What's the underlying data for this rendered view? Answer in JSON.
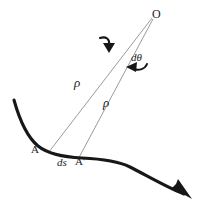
{
  "figure": {
    "background_color": "#ffffff",
    "stroke_color": "#1a1a1a",
    "thin_line_color": "#8a8a8a",
    "width": 206,
    "height": 208,
    "labels": {
      "center_point": "O",
      "angle_increment": "dθ",
      "radius_1": "ρ",
      "radius_2": "ρ",
      "point_a": "A",
      "arc_length": "ds",
      "point_a_prime": "A'"
    },
    "elements": {
      "curve_name": "curved path with arrowhead",
      "radius_line_1": "radius line from O to A",
      "radius_line_2": "radius line from O to A prime",
      "angle_arrow_outer": "curved arrow indicating rotation",
      "angle_arrow_inner": "curved arrow indicating d-theta rotation",
      "path_arrowhead": "direction of travel arrowhead"
    }
  }
}
